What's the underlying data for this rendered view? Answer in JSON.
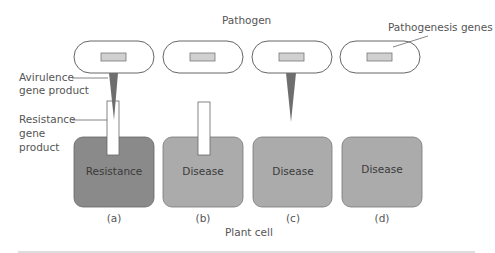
{
  "title": "Pathogen",
  "labels": {
    "pathogenesis_genes": "Pathogenesis genes",
    "avirulence_line1": "Avirulence",
    "avirulence_line2": "gene product",
    "resistance_line1": "Resistance",
    "resistance_line2": "gene",
    "resistance_line3": "product",
    "plant_cell": "Plant cell"
  },
  "panels": [
    {
      "id": "a",
      "label": "(a)",
      "outcome": "Resistance",
      "avirulence": true,
      "resistance": true,
      "color": "#8a8a8a"
    },
    {
      "id": "b",
      "label": "(b)",
      "outcome": "Disease",
      "avirulence": false,
      "resistance": true,
      "color": "#ababab"
    },
    {
      "id": "c",
      "label": "(c)",
      "outcome": "Disease",
      "avirulence": true,
      "resistance": false,
      "color": "#ababab"
    },
    {
      "id": "d",
      "label": "(d)",
      "outcome": "Disease",
      "avirulence": false,
      "resistance": false,
      "color": "#ababab"
    }
  ]
}
